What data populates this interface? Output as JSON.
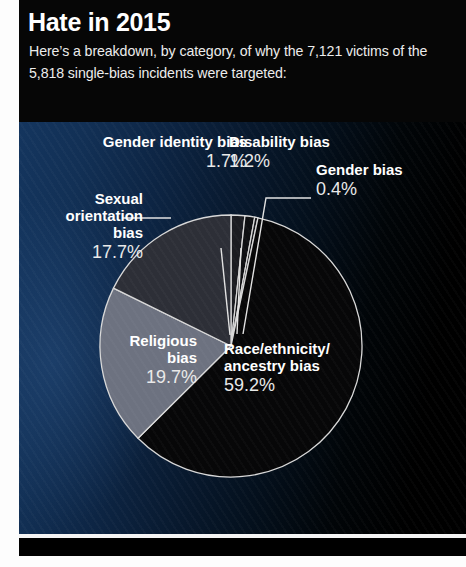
{
  "header": {
    "title": "Hate in 2015",
    "subtitle": "Here’s a breakdown, by category, of why the 7,121 victims of the 5,818 single-bias incidents were targeted:"
  },
  "chart_data": {
    "type": "pie",
    "title": "Hate in 2015",
    "categories": [
      "Gender identity bias",
      "Disability bias",
      "Gender bias",
      "Race/ethnicity/ancestry bias",
      "Religious bias",
      "Sexual orientation bias"
    ],
    "values": [
      1.7,
      1.2,
      0.4,
      59.2,
      19.7,
      17.7
    ],
    "unit": "%",
    "total_victims": "7,121",
    "total_incidents": "5,818",
    "legend": "inline-labels",
    "grid": false,
    "slices": [
      {
        "label": "Gender identity bias",
        "value": 1.7,
        "pct_text": "1.7%",
        "color": "#1b1c21"
      },
      {
        "label": "Disability bias",
        "value": 1.2,
        "pct_text": "1.2%",
        "color": "#0e0f12"
      },
      {
        "label": "Gender bias",
        "value": 0.4,
        "pct_text": "0.4%",
        "color": "#15161a"
      },
      {
        "label": "Race/ethnicity/ancestry bias",
        "value": 59.2,
        "pct_text": "59.2%",
        "color": "#070708"
      },
      {
        "label": "Religious bias",
        "value": 19.7,
        "pct_text": "19.7%",
        "color": "#6d7280"
      },
      {
        "label": "Sexual orientation bias",
        "value": 17.7,
        "pct_text": "17.7%",
        "color": "#2d2f37"
      }
    ]
  },
  "labels": {
    "gender_identity": {
      "name": "Gender identity bias",
      "pct": "1.7%"
    },
    "disability": {
      "name": "Disability bias",
      "pct": "1.2%"
    },
    "gender": {
      "name": "Gender bias",
      "pct": "0.4%"
    },
    "sexual_orientation": {
      "name_l1": "Sexual",
      "name_l2": "orientation",
      "name_l3": "bias",
      "pct": "17.7%"
    },
    "religious": {
      "name_l1": "Religious",
      "name_l2": "bias",
      "pct": "19.7%"
    },
    "race": {
      "name_l1": "Race/ethnicity/",
      "name_l2": "ancestry bias",
      "pct": "59.2%"
    }
  },
  "colors": {
    "background_left": "#14355e",
    "background_right": "#000000",
    "header_bg": "#060606",
    "text": "#ffffff",
    "slice_outline": "#d8d8d8"
  }
}
